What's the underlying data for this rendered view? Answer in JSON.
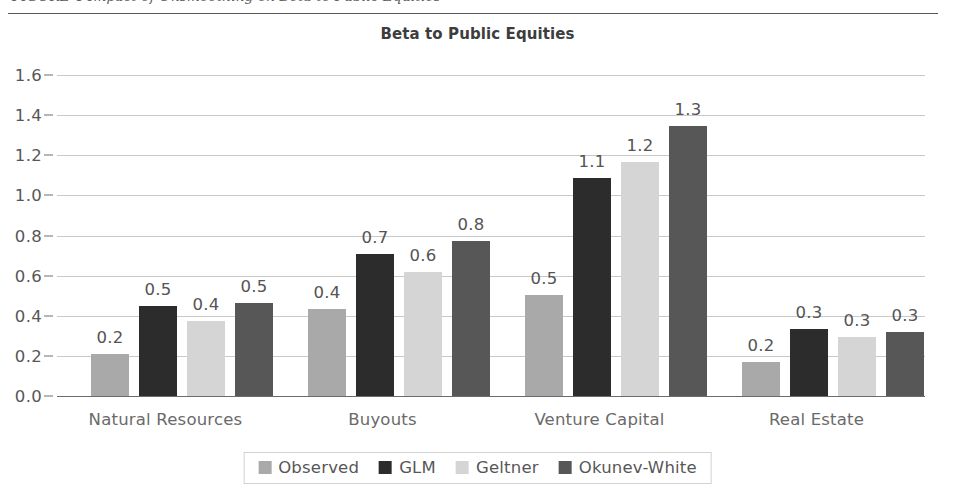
{
  "page": {
    "caption": "FIGURE 4  Impact of Unsmoothing on Beta to Public Equities",
    "background": "#ffffff"
  },
  "chart_data": {
    "type": "bar",
    "title": "Beta to Public Equities",
    "xlabel": "",
    "ylabel": "",
    "ylim": [
      0.0,
      1.6
    ],
    "ytick_step": 0.2,
    "ytick_labels": [
      "0.0",
      "0.2",
      "0.4",
      "0.6",
      "0.8",
      "1.0",
      "1.2",
      "1.4",
      "1.6"
    ],
    "grid": true,
    "legend_position": "bottom",
    "categories": [
      "Natural Resources",
      "Buyouts",
      "Venture Capital",
      "Real Estate"
    ],
    "series": [
      {
        "name": "Observed",
        "color": "#a9a9a9",
        "values": [
          0.2,
          0.4,
          0.5,
          0.2
        ],
        "labels": [
          "0.2",
          "0.4",
          "0.5",
          "0.2"
        ],
        "plotted": [
          0.21,
          0.435,
          0.505,
          0.17
        ]
      },
      {
        "name": "GLM",
        "color": "#2c2c2c",
        "values": [
          0.5,
          0.7,
          1.1,
          0.3
        ],
        "labels": [
          "0.5",
          "0.7",
          "1.1",
          "0.3"
        ],
        "plotted": [
          0.45,
          0.71,
          1.085,
          0.335
        ]
      },
      {
        "name": "Geltner",
        "color": "#d5d5d5",
        "values": [
          0.4,
          0.6,
          1.2,
          0.3
        ],
        "labels": [
          "0.4",
          "0.6",
          "1.2",
          "0.3"
        ],
        "plotted": [
          0.375,
          0.62,
          1.165,
          0.295
        ]
      },
      {
        "name": "Okunev-White",
        "color": "#575757",
        "values": [
          0.5,
          0.8,
          1.3,
          0.3
        ],
        "labels": [
          "0.5",
          "0.8",
          "1.3",
          "0.3"
        ],
        "plotted": [
          0.465,
          0.775,
          1.345,
          0.32
        ]
      }
    ]
  }
}
